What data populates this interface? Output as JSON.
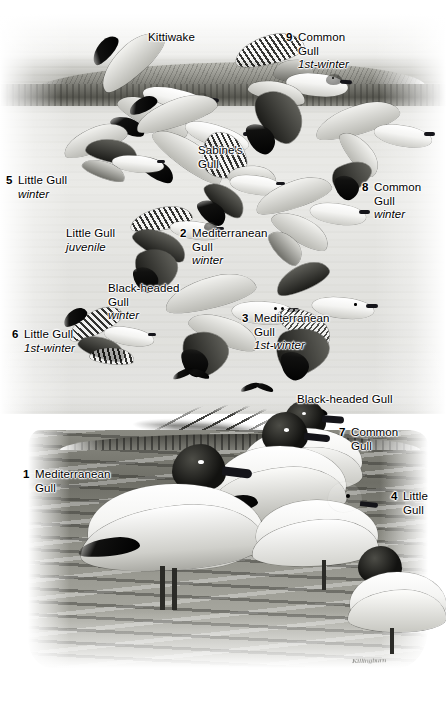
{
  "plate": {
    "title": "Gulls",
    "medium": "grayscale field-guide illustration",
    "signature": "Killingburn"
  },
  "labels": [
    {
      "id": "kittiwake",
      "name": "Kittiwake",
      "number": "",
      "qualifier": "",
      "x": 148,
      "y": 31
    },
    {
      "id": "common-gull-1st-winter",
      "name": "Common",
      "name2": "Gull",
      "number": "9",
      "qualifier": "1st-winter",
      "x": 286,
      "y": 31
    },
    {
      "id": "sabines-gull",
      "name": "Sabine's",
      "name2": "Gull",
      "number": "",
      "qualifier": "",
      "x": 198,
      "y": 144
    },
    {
      "id": "little-gull-winter",
      "name": "Little Gull",
      "number": "5",
      "qualifier": "winter",
      "x": 6,
      "y": 174
    },
    {
      "id": "common-gull-winter",
      "name": "Common",
      "name2": "Gull",
      "number": "8",
      "qualifier": "winter",
      "x": 362,
      "y": 181
    },
    {
      "id": "little-gull-juvenile",
      "name": "Little Gull",
      "number": "",
      "qualifier": "juvenile",
      "x": 66,
      "y": 227
    },
    {
      "id": "mediterranean-gull-winter",
      "name": "Mediterranean",
      "name2": "Gull",
      "number": "2",
      "qualifier": "winter",
      "x": 180,
      "y": 227
    },
    {
      "id": "black-headed-gull-winter",
      "name": "Black-headed",
      "name2": "Gull",
      "number": "",
      "qualifier": "winter",
      "x": 108,
      "y": 282
    },
    {
      "id": "mediterranean-gull-1st-winter",
      "name": "Mediterranean",
      "name2": "Gull",
      "number": "3",
      "qualifier": "1st-winter",
      "x": 242,
      "y": 312
    },
    {
      "id": "little-gull-1st-winter",
      "name": "Little Gull",
      "number": "6",
      "qualifier": "1st-winter",
      "x": 12,
      "y": 328
    },
    {
      "id": "black-headed-gull",
      "name": "Black-headed Gull",
      "number": "",
      "qualifier": "",
      "x": 297,
      "y": 393
    },
    {
      "id": "common-gull",
      "name": "Common",
      "name2": "Gull",
      "number": "7",
      "qualifier": "",
      "x": 339,
      "y": 426
    },
    {
      "id": "mediterranean-gull",
      "name": "Mediterranean",
      "name2": "Gull",
      "number": "1",
      "qualifier": "",
      "x": 23,
      "y": 468
    },
    {
      "id": "little-gull",
      "name": "Little",
      "name2": "Gull",
      "number": "4",
      "qualifier": "",
      "x": 391,
      "y": 490
    }
  ],
  "scene": {
    "upper": "flying gulls over sea with distant shoreline",
    "lower": "standing gulls on rocky shore"
  },
  "colors": {
    "paper": "#ffffff",
    "ink": "#000000",
    "water_mid": "#d6d6d2",
    "hill_dark": "#6f6f69",
    "rock_dark": "#6e6e66",
    "rock_light": "#b6b6ae"
  }
}
